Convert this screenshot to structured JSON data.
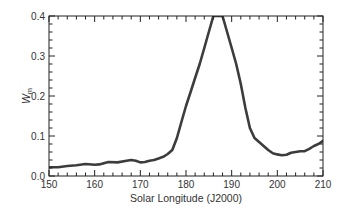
{
  "chart_data": {
    "type": "line",
    "title": "",
    "xlabel": "Solar Longitude (J2000)",
    "ylabel": "W",
    "ylabel_subscript": "m",
    "xlim": [
      150,
      210
    ],
    "ylim": [
      0.0,
      0.4
    ],
    "x_ticks": [
      150,
      160,
      170,
      180,
      190,
      200,
      210
    ],
    "x_tick_labels": [
      "150",
      "160",
      "170",
      "180",
      "190",
      "200",
      "210"
    ],
    "y_ticks": [
      0.0,
      0.1,
      0.2,
      0.3,
      0.4
    ],
    "y_tick_labels": [
      "0.0",
      "0.1",
      "0.2",
      "0.3",
      "0.4"
    ],
    "x_minor_step": 2,
    "y_minor_step": 0.02,
    "grid": false,
    "legend": null,
    "series": [
      {
        "name": "Wm",
        "color": "#1a1a1a",
        "x": [
          150,
          152,
          154,
          156,
          158,
          160,
          161,
          163,
          165,
          167,
          168,
          169,
          170,
          171,
          172,
          173,
          174,
          175,
          176,
          177,
          178,
          179,
          180,
          181,
          182,
          183,
          184,
          185,
          186,
          187,
          188,
          189,
          190,
          191,
          192,
          193,
          194,
          195,
          196,
          197,
          198,
          199,
          200,
          201,
          202,
          203,
          204,
          205,
          206,
          207,
          208,
          209,
          210
        ],
        "values": [
          0.022,
          0.022,
          0.025,
          0.027,
          0.03,
          0.028,
          0.029,
          0.035,
          0.034,
          0.038,
          0.04,
          0.038,
          0.034,
          0.035,
          0.038,
          0.04,
          0.044,
          0.048,
          0.055,
          0.065,
          0.095,
          0.135,
          0.175,
          0.21,
          0.245,
          0.28,
          0.32,
          0.36,
          0.4,
          0.4,
          0.4,
          0.36,
          0.32,
          0.28,
          0.23,
          0.17,
          0.12,
          0.095,
          0.085,
          0.075,
          0.065,
          0.057,
          0.054,
          0.052,
          0.053,
          0.058,
          0.06,
          0.062,
          0.062,
          0.068,
          0.075,
          0.08,
          0.088
        ]
      }
    ]
  }
}
